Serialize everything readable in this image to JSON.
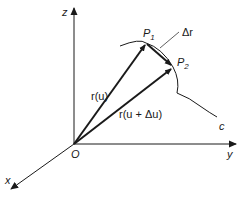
{
  "diagram": {
    "axes": {
      "z_label": "z",
      "y_label": "y",
      "x_label": "x",
      "origin_label": "O"
    },
    "points": {
      "p1_label": "P",
      "p1_sub": "1",
      "p2_label": "P",
      "p2_sub": "2"
    },
    "vectors": {
      "r_u_label": "r(u)",
      "r_u_du_label": "r(u + Δu)",
      "delta_r_label": "Δr"
    },
    "curve_label": "c",
    "colors": {
      "ink": "#1a1a1a",
      "background": "#ffffff"
    }
  }
}
